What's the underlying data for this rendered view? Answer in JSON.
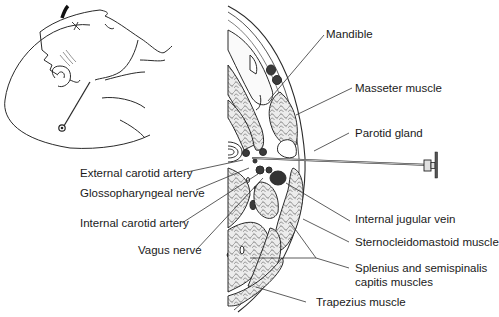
{
  "figure": {
    "type": "anatomical-illustration",
    "inset": "head-profile-with-needle",
    "main": "axial-cross-section-neck-with-needle"
  },
  "labels": {
    "mandible": "Mandible",
    "masseter": "Masseter muscle",
    "parotid": "Parotid gland",
    "ext_carotid": "External carotid artery",
    "glosso": "Glossopharyngeal nerve",
    "int_carotid": "Internal carotid artery",
    "vagus": "Vagus nerve",
    "int_jugular": "Internal jugular vein",
    "scm": "Sternocleidomastoid muscle",
    "splenius_1": "Splenius and semispinalis",
    "splenius_2": "capitis muscles",
    "trapezius": "Trapezius muscle"
  },
  "colors": {
    "line": "#2a2a2a",
    "vessel": "#3a3a3a",
    "muscle_fill": "#e6e6e6"
  }
}
